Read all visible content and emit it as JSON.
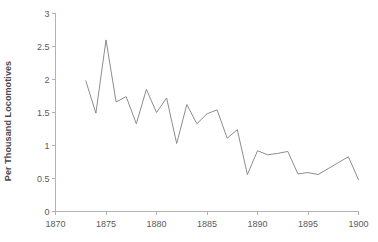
{
  "chart_data": {
    "type": "line",
    "title": "",
    "subtitle": "",
    "xlabel": "",
    "ylabel": "Per Thousand Locomotives",
    "xlim": [
      1870,
      1900
    ],
    "ylim": [
      0,
      3
    ],
    "grid": false,
    "legend": false,
    "legend_position": "none",
    "x_ticks": [
      1870,
      1875,
      1880,
      1885,
      1890,
      1895,
      1900
    ],
    "x_tick_labels": [
      "1870",
      "1875",
      "1880",
      "1885",
      "1890",
      "1895",
      "1900"
    ],
    "y_ticks": [
      0,
      0.5,
      1,
      1.5,
      2,
      2.5,
      3
    ],
    "y_tick_labels": [
      "0",
      "0.5",
      "1",
      "1.5",
      "2",
      "2.5",
      "3"
    ],
    "line_color": "#808080",
    "axis_color": "#b3b3b3",
    "x": [
      1873,
      1874,
      1875,
      1876,
      1877,
      1878,
      1879,
      1880,
      1881,
      1882,
      1883,
      1884,
      1885,
      1886,
      1887,
      1888,
      1889,
      1890,
      1891,
      1892,
      1893,
      1894,
      1895,
      1896,
      1897,
      1898,
      1899,
      1900
    ],
    "values": [
      1.98,
      1.49,
      2.6,
      1.66,
      1.74,
      1.33,
      1.85,
      1.5,
      1.72,
      1.03,
      1.62,
      1.33,
      1.48,
      1.54,
      1.11,
      1.24,
      0.56,
      0.92,
      0.86,
      0.88,
      0.91,
      0.57,
      0.59,
      0.56,
      0.65,
      0.74,
      0.83,
      0.48
    ],
    "series": [
      {
        "name": "Per Thousand Locomotives",
        "values": [
          1.98,
          1.49,
          2.6,
          1.66,
          1.74,
          1.33,
          1.85,
          1.5,
          1.72,
          1.03,
          1.62,
          1.33,
          1.48,
          1.54,
          1.11,
          1.24,
          0.56,
          0.92,
          0.86,
          0.88,
          0.91,
          0.57,
          0.59,
          0.56,
          0.65,
          0.74,
          0.83,
          0.48
        ]
      }
    ]
  },
  "axis": {
    "y_title": "Per Thousand Locomotives"
  }
}
